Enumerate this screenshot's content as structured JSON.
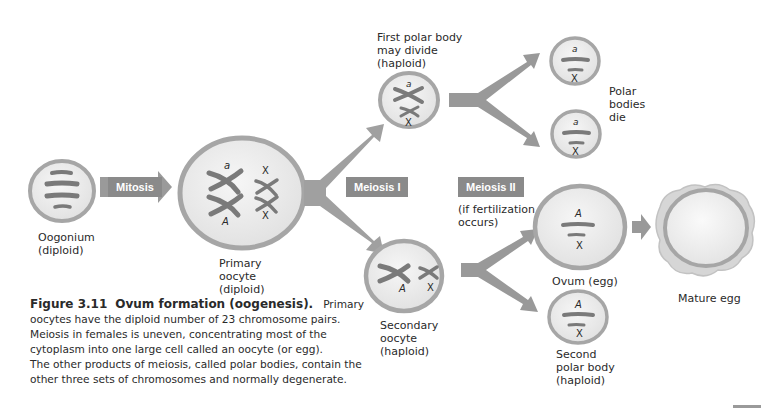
{
  "figure": {
    "number": "Figure 3.11",
    "title": "Ovum formation (oogenesis).",
    "caption_lines": [
      "Primary",
      "oocytes have the diploid number of 23 chromosome pairs.",
      "Meiosis in females is uneven, concentrating most of the",
      "cytoplasm into one large cell called an oocyte (or egg).",
      "The other products of meiosis, called polar bodies, contain the",
      "other three sets of chromosomes and normally degenerate."
    ]
  },
  "colors": {
    "cell_fill": "#e8e8e8",
    "cell_border": "#a6a6a6",
    "chromosome": "#7a7a7a",
    "arrow": "#999999",
    "stage_tag_bg": "#8a8a8a",
    "stage_tag_text": "#ffffff"
  },
  "stages": {
    "mitosis": "Mitosis",
    "meiosis_1": "Meiosis I",
    "meiosis_2": "Meiosis II",
    "meiosis_2_note": [
      "(if fertilization",
      "occurs)"
    ]
  },
  "cells": {
    "oogonium": {
      "label": [
        "Oogonium",
        "(diploid)"
      ]
    },
    "primary_oocyte": {
      "label": [
        "Primary",
        "oocyte",
        "(diploid)"
      ],
      "alleles": [
        "a",
        "A"
      ],
      "sex_chromosomes": [
        "X",
        "X"
      ]
    },
    "first_polar_body": {
      "label": [
        "First polar body",
        "may divide",
        "(haploid)"
      ],
      "allele": "a",
      "sex_chromosome": "X"
    },
    "polar_body_top_1": {
      "allele": "a",
      "sex_chromosome": "X"
    },
    "polar_body_top_2": {
      "allele": "a",
      "sex_chromosome": "X"
    },
    "polar_bodies_die": {
      "label": [
        "Polar",
        "bodies",
        "die"
      ]
    },
    "secondary_oocyte": {
      "label": [
        "Secondary",
        "oocyte",
        "(haploid)"
      ],
      "allele": "A",
      "sex_chromosome": "X"
    },
    "ovum": {
      "label": [
        "Ovum (egg)"
      ],
      "allele": "A",
      "sex_chromosome": "X"
    },
    "second_polar_body": {
      "label": [
        "Second",
        "polar body",
        "(haploid)"
      ],
      "allele": "A",
      "sex_chromosome": "X"
    },
    "mature_egg": {
      "label": [
        "Mature egg"
      ]
    }
  }
}
